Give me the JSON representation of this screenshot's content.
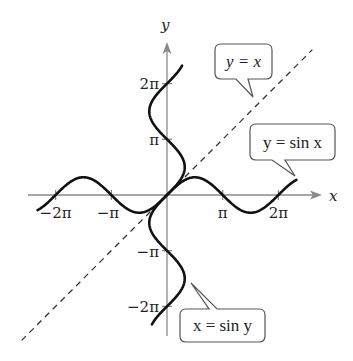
{
  "chart_data": {
    "type": "line",
    "title": "",
    "xlabel": "x",
    "ylabel": "y",
    "xlim": [
      -6.9,
      8.0
    ],
    "ylim": [
      -8.1,
      8.1
    ],
    "grid": false,
    "x_tick_labels": [
      "−2π",
      "−π",
      "π",
      "2π"
    ],
    "x_ticks": [
      -6.2832,
      -3.1416,
      3.1416,
      6.2832
    ],
    "y_tick_labels": [
      "2π",
      "π",
      "−π",
      "−2π"
    ],
    "y_ticks": [
      6.2832,
      3.1416,
      -3.1416,
      -6.2832
    ],
    "series": [
      {
        "name": "y = sin x",
        "style": "solid",
        "equation": "y = sin(x)",
        "x_range": [
          -7.3,
          7.3
        ]
      },
      {
        "name": "x = sin y",
        "style": "solid",
        "equation": "x = sin(y)",
        "y_range": [
          -7.3,
          7.3
        ]
      },
      {
        "name": "y = x",
        "style": "dashed",
        "equation": "y = x",
        "x_range": [
          -8.2,
          8.2
        ]
      }
    ],
    "annotations": [
      {
        "text": "y = x",
        "points_to": "dashed line"
      },
      {
        "text": "y = sin x",
        "points_to": "sine curve"
      },
      {
        "text": "x = sin y",
        "points_to": "inverse sine curve"
      }
    ]
  },
  "labels": {
    "x_axis": "x",
    "y_axis": "y",
    "xt_m2pi": "−2π",
    "xt_mpi": "−π",
    "xt_pi": "π",
    "xt_2pi": "2π",
    "yt_2pi": "2π",
    "yt_pi": "π",
    "yt_mpi": "−π",
    "yt_m2pi": "−2π"
  },
  "callouts": {
    "line": "y = x",
    "sine": "y = sin x",
    "inverse": "x = sin y"
  }
}
